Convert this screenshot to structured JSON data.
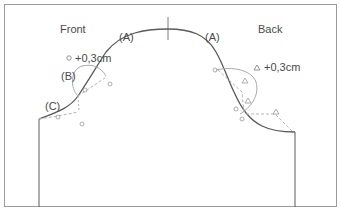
{
  "diagram": {
    "labels": {
      "front": "Front",
      "back": "Back",
      "a_front": "(A)",
      "a_back": "(A)",
      "b": "(B)",
      "c": "(C)",
      "front_adjust": "+0,3cm",
      "back_adjust": "+0,3cm"
    },
    "markers": {
      "front_symbol": "circle",
      "back_symbol": "triangle"
    },
    "colors": {
      "frame": "#9a9a9a",
      "main_curve": "#5a5a5a",
      "guide_curve": "#a8a8a8",
      "dashed": "#b5b5b5",
      "text": "#4a4a4a"
    }
  }
}
